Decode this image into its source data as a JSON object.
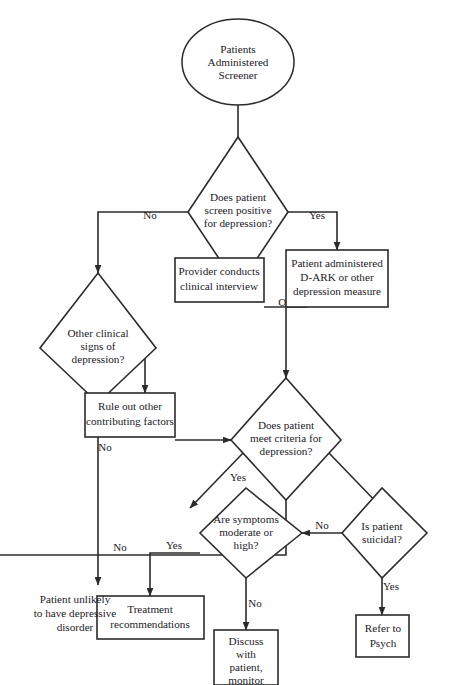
{
  "diagram": {
    "orientation": "rotated-90-ccw",
    "canvas": {
      "width": 450,
      "height": 685
    },
    "colors": {
      "stroke": "#2b2b2b",
      "fill": "#ffffff",
      "text": "#23211f",
      "background": "#fefefe"
    },
    "nodes": [
      {
        "id": "start",
        "type": "ellipse",
        "lines": [
          "Patients",
          "Administered",
          "Screener"
        ]
      },
      {
        "id": "screen-positive",
        "type": "decision",
        "lines": [
          "Does patient",
          "screen positive",
          "for depression?"
        ]
      },
      {
        "id": "other-signs",
        "type": "decision",
        "lines": [
          "Other clinical",
          "signs of",
          "depression?"
        ]
      },
      {
        "id": "dark-measure",
        "type": "process",
        "lines": [
          "Patient administered",
          "D-ARK or other",
          "depression measure"
        ]
      },
      {
        "id": "clinical-interview",
        "type": "process",
        "lines": [
          "Provider conducts",
          "clinical interview"
        ]
      },
      {
        "id": "rule-out",
        "type": "process",
        "lines": [
          "Rule out other",
          "contributing factors"
        ]
      },
      {
        "id": "meets-criteria",
        "type": "decision",
        "lines": [
          "Does patient",
          "meet criteria for",
          "depression?"
        ]
      },
      {
        "id": "suicidal",
        "type": "decision",
        "lines": [
          "Is patient",
          "suicidal?"
        ]
      },
      {
        "id": "symptoms-severity",
        "type": "decision",
        "lines": [
          "Are symptoms",
          "moderate or",
          "high?"
        ]
      },
      {
        "id": "refer-psych",
        "type": "process",
        "lines": [
          "Refer to",
          "Psych"
        ]
      },
      {
        "id": "discuss-monitor",
        "type": "process",
        "lines": [
          "Discuss",
          "with",
          "patient,",
          "monitor"
        ]
      },
      {
        "id": "treatment",
        "type": "process",
        "lines": [
          "Treatment",
          "recommendations"
        ]
      },
      {
        "id": "unlikely",
        "type": "plain-text",
        "lines": [
          "Patient unlikely",
          "to have depressive",
          "disorder"
        ]
      }
    ],
    "connector_labels": {
      "screen_yes": "Yes",
      "screen_no": "No",
      "or": "OR",
      "other_signs_yes": "Yes",
      "other_signs_no": "No",
      "criteria_yes_left": "Yes",
      "criteria_no": "No",
      "suicidal_yes": "Yes",
      "suicidal_no": "No",
      "severity_yes": "Yes",
      "severity_no": "No"
    }
  }
}
